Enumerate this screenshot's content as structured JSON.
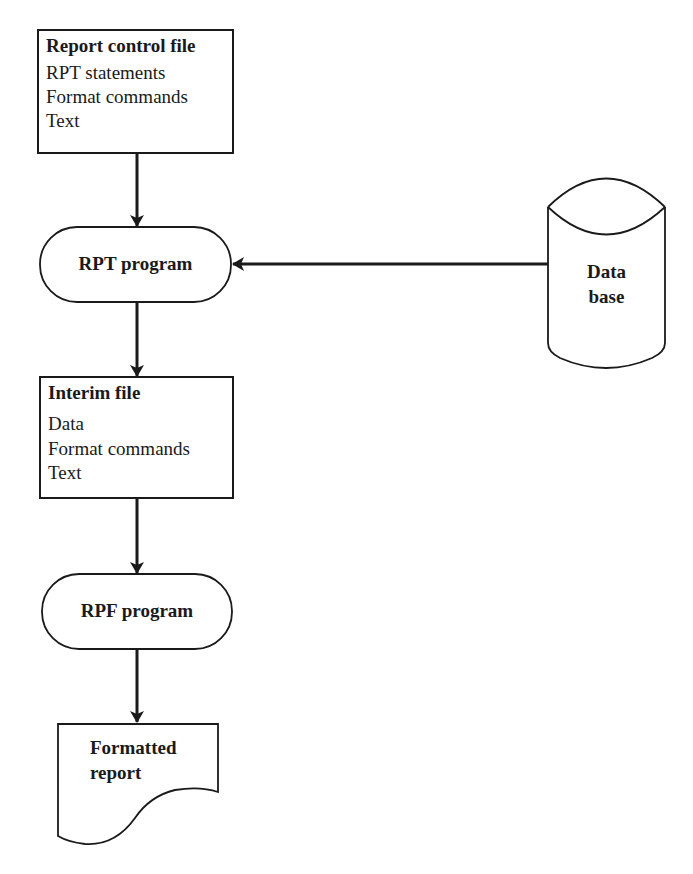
{
  "diagram": {
    "colors": {
      "stroke": "#1a1a1a",
      "background": "#ffffff"
    },
    "nodes": {
      "report_control_file": {
        "shape": "rectangle",
        "title": "Report control file",
        "lines": [
          "RPT statements",
          "Format commands",
          "Text"
        ]
      },
      "rpt_program": {
        "shape": "terminator",
        "label": "RPT program"
      },
      "database": {
        "shape": "cylinder",
        "label_line1": "Data",
        "label_line2": "base"
      },
      "interim_file": {
        "shape": "rectangle",
        "title": "Interim file",
        "lines": [
          "Data",
          "Format commands",
          "Text"
        ]
      },
      "rpf_program": {
        "shape": "terminator",
        "label": "RPF program"
      },
      "formatted_report": {
        "shape": "document",
        "label_line1": "Formatted",
        "label_line2": "report"
      }
    },
    "edges": [
      {
        "from": "Report control file",
        "to": "RPT program"
      },
      {
        "from": "Data base",
        "to": "RPT program"
      },
      {
        "from": "RPT program",
        "to": "Interim file"
      },
      {
        "from": "Interim file",
        "to": "RPF program"
      },
      {
        "from": "RPF program",
        "to": "Formatted report"
      }
    ]
  }
}
